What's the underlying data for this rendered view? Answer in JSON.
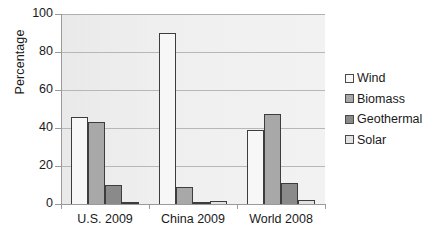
{
  "chart_data": {
    "type": "bar",
    "title": "",
    "subtitle": "",
    "xlabel": "",
    "ylabel": "Percentage",
    "ylim": [
      0,
      100
    ],
    "yticks": [
      0,
      20,
      40,
      60,
      80,
      100
    ],
    "ytick_labels": [
      "0",
      "20",
      "40",
      "60",
      "80",
      "100"
    ],
    "grid": true,
    "legend_position": "right",
    "categories": [
      "U.S. 2009",
      "China 2009",
      "World 2008"
    ],
    "series": [
      {
        "name": "Wind",
        "color": "#f7f7f7",
        "values": [
          46,
          90,
          39
        ]
      },
      {
        "name": "Biomass",
        "color": "#a8a8a8",
        "values": [
          43,
          9,
          47.5
        ]
      },
      {
        "name": "Geothermal",
        "color": "#8a8a8a",
        "values": [
          10,
          0,
          11
        ]
      },
      {
        "name": "Solar",
        "color": "#e2e2e2",
        "values": [
          0.5,
          1.5,
          2
        ]
      }
    ]
  },
  "axis": {
    "y_title": "Percentage"
  }
}
